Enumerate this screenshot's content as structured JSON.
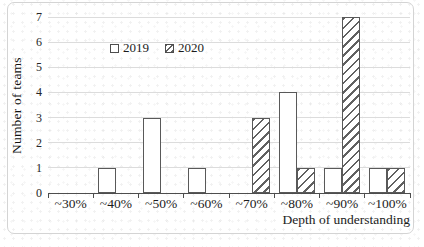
{
  "chart_data": {
    "type": "bar",
    "categories": [
      "~30%",
      "~40%",
      "~50%",
      "~60%",
      "~70%",
      "~80%",
      "~90%",
      "~100%"
    ],
    "series": [
      {
        "name": "2019",
        "style": "white",
        "values": [
          0,
          1,
          3,
          1,
          0,
          4,
          1,
          1
        ]
      },
      {
        "name": "2020",
        "style": "hatched",
        "values": [
          0,
          0,
          0,
          0,
          3,
          1,
          7,
          1
        ]
      }
    ],
    "title": "",
    "xlabel": "Depth of understanding",
    "ylabel": "Number of teams",
    "ylim": [
      0,
      7
    ],
    "yticks": [
      0,
      1,
      2,
      3,
      4,
      5,
      6,
      7
    ],
    "grid": "horizontal",
    "legend_position": "top-left-inside"
  },
  "colors": {
    "bar_outline": "#595959",
    "bar_fill_2019": "#ffffff",
    "hatch_stroke": "#616161",
    "gridline": "#dcdcdc",
    "axis_line": "#4d4d4d",
    "text": "#1c1c1c",
    "frame_border": "#d4d4d4",
    "background": "#ffffff"
  }
}
